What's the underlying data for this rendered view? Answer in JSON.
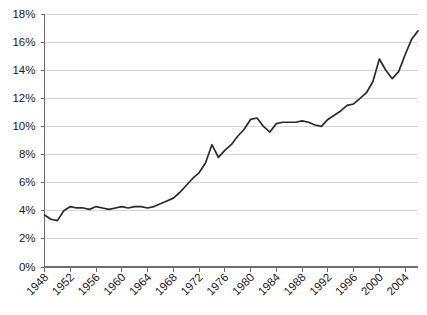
{
  "chart_data": {
    "type": "line",
    "title": "",
    "subtitle": "",
    "xlabel": "",
    "ylabel": "",
    "grid": "horizontal",
    "legend_position": "none",
    "line_color": "#2b2b2b",
    "gridline_color": "#d6d6d6",
    "axis_color": "#6e6e6e",
    "background_color": "#ffffff",
    "xlim": [
      1948,
      2006
    ],
    "ylim": [
      0,
      18
    ],
    "ytick_labels": [
      "18%",
      "16%",
      "14%",
      "12%",
      "10%",
      "8%",
      "6%",
      "4%",
      "2%",
      "0%"
    ],
    "ytick_values": [
      18,
      16,
      14,
      12,
      10,
      8,
      6,
      4,
      2,
      0
    ],
    "xtick_labels": [
      "1948",
      "1952",
      "1956",
      "1960",
      "1964",
      "1968",
      "1972",
      "1976",
      "1980",
      "1984",
      "1988",
      "1992",
      "1996",
      "2000",
      "2004"
    ],
    "xtick_values": [
      1948,
      1952,
      1956,
      1960,
      1964,
      1968,
      1972,
      1976,
      1980,
      1984,
      1988,
      1992,
      1996,
      2000,
      2004
    ],
    "x": [
      1948,
      1949,
      1950,
      1951,
      1952,
      1953,
      1954,
      1955,
      1956,
      1957,
      1958,
      1959,
      1960,
      1961,
      1962,
      1963,
      1964,
      1965,
      1966,
      1967,
      1968,
      1969,
      1970,
      1971,
      1972,
      1973,
      1974,
      1975,
      1976,
      1977,
      1978,
      1979,
      1980,
      1981,
      1982,
      1983,
      1984,
      1985,
      1986,
      1987,
      1988,
      1989,
      1990,
      1991,
      1992,
      1993,
      1994,
      1995,
      1996,
      1997,
      1998,
      1999,
      2000,
      2001,
      2002,
      2003,
      2004,
      2005,
      2006
    ],
    "values": [
      3.7,
      3.4,
      3.3,
      4.0,
      4.3,
      4.2,
      4.2,
      4.1,
      4.3,
      4.2,
      4.1,
      4.2,
      4.3,
      4.2,
      4.3,
      4.3,
      4.2,
      4.3,
      4.5,
      4.7,
      4.9,
      5.3,
      5.8,
      6.3,
      6.7,
      7.4,
      8.7,
      7.8,
      8.3,
      8.7,
      9.3,
      9.8,
      10.5,
      10.6,
      10.0,
      9.6,
      10.2,
      10.3,
      10.3,
      10.3,
      10.4,
      10.3,
      10.1,
      10.0,
      10.5,
      10.8,
      11.1,
      11.5,
      11.6,
      12.0,
      12.4,
      13.2,
      14.8,
      14.0,
      13.4,
      13.9,
      15.1,
      16.2,
      16.8
    ],
    "series": [
      {
        "name": "series-1",
        "values": [
          3.7,
          3.4,
          3.3,
          4.0,
          4.3,
          4.2,
          4.2,
          4.1,
          4.3,
          4.2,
          4.1,
          4.2,
          4.3,
          4.2,
          4.3,
          4.3,
          4.2,
          4.3,
          4.5,
          4.7,
          4.9,
          5.3,
          5.8,
          6.3,
          6.7,
          7.4,
          8.7,
          7.8,
          8.3,
          8.7,
          9.3,
          9.8,
          10.5,
          10.6,
          10.0,
          9.6,
          10.2,
          10.3,
          10.3,
          10.3,
          10.4,
          10.3,
          10.1,
          10.0,
          10.5,
          10.8,
          11.1,
          11.5,
          11.6,
          12.0,
          12.4,
          13.2,
          14.8,
          14.0,
          13.4,
          13.9,
          15.1,
          16.2,
          16.8
        ]
      }
    ],
    "annotations": []
  }
}
